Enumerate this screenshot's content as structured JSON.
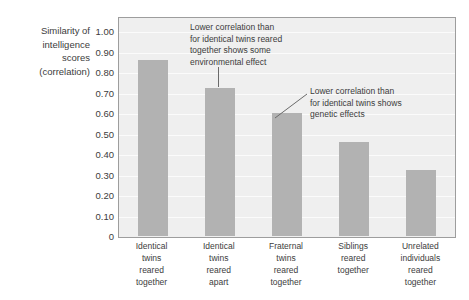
{
  "chart_data": {
    "type": "bar",
    "title": "",
    "ylabel": "Similarity of intelligence scores (correlation)",
    "ylabel_lines": [
      "Similarity of",
      "intelligence",
      "scores",
      "(correlation)"
    ],
    "xlabel": "",
    "ylim": [
      0,
      1.0
    ],
    "grid": true,
    "legend": "none",
    "categories": [
      "Identical twins reared together",
      "Identical twins reared apart",
      "Fraternal twins reared together",
      "Siblings reared together",
      "Unrelated individuals reared together"
    ],
    "category_lines": [
      [
        "Identical",
        "twins",
        "reared",
        "together"
      ],
      [
        "Identical",
        "twins",
        "reared",
        "apart"
      ],
      [
        "Fraternal",
        "twins",
        "reared",
        "together"
      ],
      [
        "Siblings",
        "reared",
        "together"
      ],
      [
        "Unrelated",
        "individuals",
        "reared",
        "together"
      ]
    ],
    "values": [
      0.86,
      0.72,
      0.6,
      0.46,
      0.32
    ],
    "ytick_labels": [
      "1.00",
      "0.90",
      "0.80",
      "0.70",
      "0.60",
      "0.50",
      "0.40",
      "0.30",
      "0.20",
      "0.10",
      "0"
    ],
    "ytick_values": [
      1.0,
      0.9,
      0.8,
      0.7,
      0.6,
      0.5,
      0.4,
      0.3,
      0.2,
      0.1,
      0
    ],
    "annotations": [
      {
        "id": "environmental",
        "text": "Lower correlation than\nfor identical twins reared\ntogether shows some\nenvironmental effect",
        "points_to_category": "Identical twins reared apart"
      },
      {
        "id": "genetic",
        "text": "Lower correlation than\nfor identical twins shows\ngenetic effects",
        "points_to_category": "Fraternal twins reared together"
      }
    ],
    "colors": {
      "bar": "#b2b2b2",
      "plot_background": "#efefef",
      "gridline": "#fbfbfb",
      "axis": "#9d9d9d",
      "text": "#3c3c3c",
      "page_background": "#ffffff"
    }
  }
}
